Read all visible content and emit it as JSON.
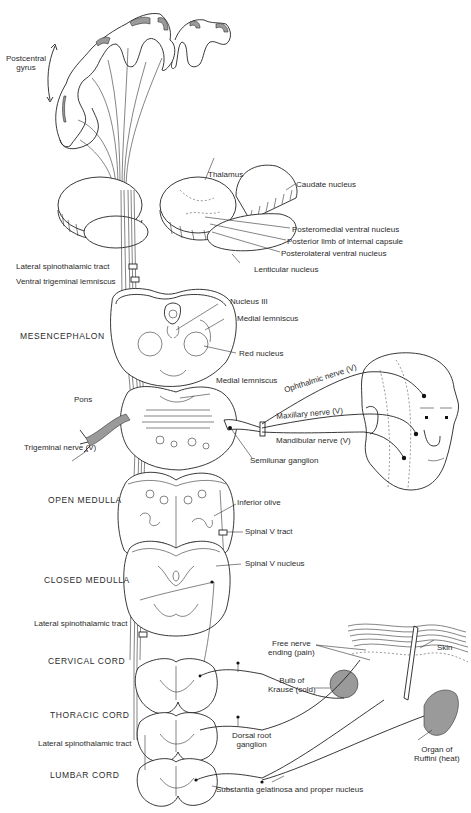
{
  "figure": {
    "labels": {
      "postcentral_gyrus": "Postcentral\ngyrus",
      "thalamus": "Thalamus",
      "caudate_nucleus": "Caudate nucleus",
      "posteromedial_ventral_nucleus": "Posteromedial ventral nucleus",
      "posterior_limb_internal_capsule": "Posterior limb of internal capsule",
      "posterolateral_ventral_nucleus": "Posterolateral ventral nucleus",
      "lenticular_nucleus": "Lenticular nucleus",
      "lateral_spinothalamic_tract_upper": "Lateral spinothalamic tract",
      "ventral_trigeminal_lemniscus": "Ventral trigeminal lemniscus",
      "nucleus_iii": "Nucleus III",
      "medial_lemniscus_mesencephalon": "Medial lemniscus",
      "red_nucleus": "Red nucleus",
      "medial_lemniscus_pons": "Medial lemniscus",
      "ophthalmic_nerve": "Ophthalmic nerve (V)",
      "maxillary_nerve": "Maxillary nerve (V)",
      "mandibular_nerve": "Mandibular nerve (V)",
      "semilunar_ganglion": "Semilunar ganglion",
      "trigeminal_nerve": "Trigeminal nerve (V)",
      "inferior_olive": "Inferior olive",
      "spinal_v_tract": "Spinal V tract",
      "spinal_v_nucleus": "Spinal V nucleus",
      "lateral_spinothalamic_tract_middle": "Lateral spinothalamic tract",
      "lateral_spinothalamic_tract_lower": "Lateral spinothalamic tract",
      "free_nerve_ending": "Free nerve\nending (pain)",
      "skin": "Skin",
      "bulb_of_krause": "Bulb of\nKrause (cold)",
      "dorsal_root_ganglion": "Dorsal root\nganglion",
      "organ_of_ruffini": "Organ of\nRuffini (heat)",
      "substantia_gelatinosa": "Substantia gelatinosa and proper nucleus"
    },
    "levels": {
      "mesencephalon": "MESENCEPHALON",
      "pons": "Pons",
      "open_medulla": "OPEN MEDULLA",
      "closed_medulla": "CLOSED MEDULLA",
      "cervical_cord": "CERVICAL CORD",
      "thoracic_cord": "THORACIC CORD",
      "lumbar_cord": "LUMBAR CORD"
    }
  }
}
